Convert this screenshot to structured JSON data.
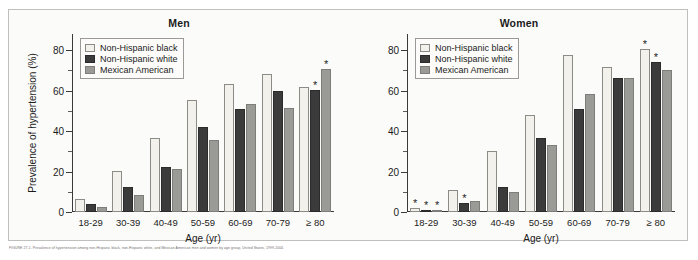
{
  "figure": {
    "caption": "FIGURE 27-1. Prevalence of hypertension among non-Hispanic black, non-Hispanic white, and Mexican American men and women by age group, United States, 1999-2004."
  },
  "chart_data": {
    "type": "bar",
    "xlabel": "Age (yr)",
    "ylabel": "Prevalence of hypertension (%)",
    "ylim": [
      0,
      88
    ],
    "yticks": [
      0,
      20,
      40,
      60,
      80
    ],
    "ytick_labels": [
      "0",
      "20",
      "40",
      "60",
      "80"
    ],
    "yminor": [
      10,
      30,
      50,
      70
    ],
    "grid": false,
    "legend_position": "upper left",
    "categories": [
      "18-29",
      "30-39",
      "40-49",
      "50-59",
      "60-69",
      "70-79",
      "≥ 80"
    ],
    "series_names": [
      "Non-Hispanic black",
      "Non-Hispanic white",
      "Mexican American"
    ],
    "series_colors": [
      "#f3f1ec",
      "#3b3b3b",
      "#9a9a97"
    ],
    "annotation_symbol": "*",
    "panels": [
      {
        "name": "Men",
        "series": [
          {
            "name": "Non-Hispanic black",
            "values": [
              6.5,
              20.5,
              36.5,
              55.5,
              63.5,
              68.0,
              62.0
            ],
            "stars": [
              false,
              false,
              false,
              false,
              false,
              false,
              false
            ]
          },
          {
            "name": "Non-Hispanic white",
            "values": [
              4.0,
              12.5,
              22.5,
              42.0,
              51.0,
              60.0,
              60.5
            ],
            "stars": [
              false,
              false,
              false,
              false,
              false,
              false,
              true
            ]
          },
          {
            "name": "Mexican American",
            "values": [
              2.5,
              8.5,
              21.5,
              35.5,
              53.5,
              51.5,
              70.5
            ],
            "stars": [
              false,
              false,
              false,
              false,
              false,
              false,
              true
            ]
          }
        ]
      },
      {
        "name": "Women",
        "series": [
          {
            "name": "Non-Hispanic black",
            "values": [
              1.8,
              11.0,
              30.0,
              48.0,
              77.5,
              71.5,
              80.5
            ],
            "stars": [
              true,
              false,
              false,
              false,
              false,
              false,
              true
            ]
          },
          {
            "name": "Non-Hispanic white",
            "values": [
              0.8,
              4.5,
              12.5,
              36.5,
              51.0,
              66.5,
              74.0
            ],
            "stars": [
              true,
              true,
              false,
              false,
              false,
              false,
              true
            ]
          },
          {
            "name": "Mexican American",
            "values": [
              1.2,
              5.5,
              10.0,
              33.0,
              58.5,
              66.5,
              70.0
            ],
            "stars": [
              true,
              false,
              false,
              false,
              false,
              false,
              false
            ]
          }
        ]
      }
    ]
  }
}
